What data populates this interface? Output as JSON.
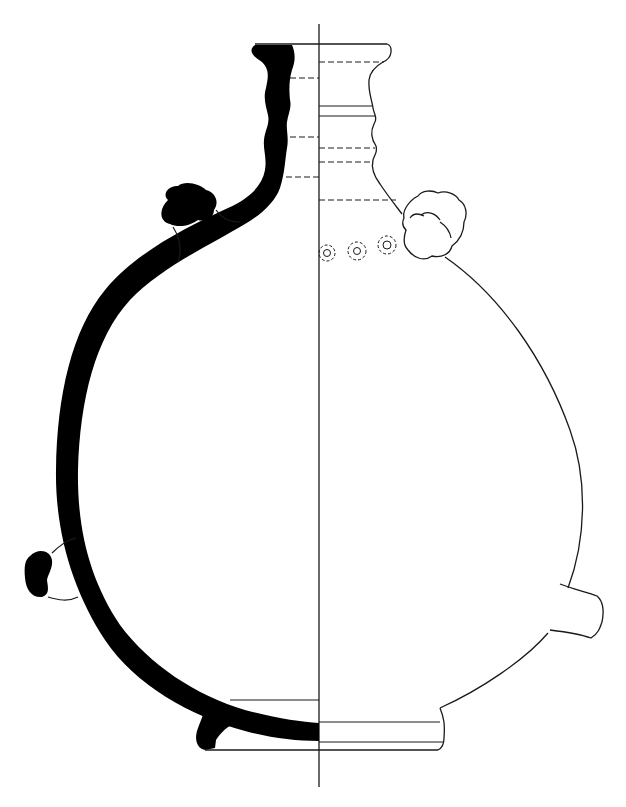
{
  "figure": {
    "type": "archaeological pottery profile drawing",
    "subject": "flask / pilgrim-bottle with ring-decorated shoulder and lugs",
    "convention": "left half shows section (solid black wall), right half shows exterior elevation",
    "colors": {
      "background": "#ffffff",
      "section_fill": "#000000",
      "line": "#1a1a1a"
    },
    "components": [
      {
        "id": "central-axis",
        "label": "vertical axis of symmetry"
      },
      {
        "id": "rim",
        "label": "everted rim"
      },
      {
        "id": "neck",
        "label": "ribbed neck with two horizontal ridges"
      },
      {
        "id": "shoulder-lug-left",
        "label": "applied knobbed lug (section)"
      },
      {
        "id": "shoulder-lug-right",
        "label": "applied knobbed lug (elevation)"
      },
      {
        "id": "stamped-rings",
        "label": "row of three stamped concentric-ring motifs"
      },
      {
        "id": "body",
        "label": "globular body"
      },
      {
        "id": "lower-lug-left",
        "label": "lower handle stub (section)"
      },
      {
        "id": "lower-lug-right",
        "label": "lower handle stub (elevation)"
      },
      {
        "id": "foot",
        "label": "ring base / foot"
      }
    ],
    "stamped_ring_count": 3
  }
}
